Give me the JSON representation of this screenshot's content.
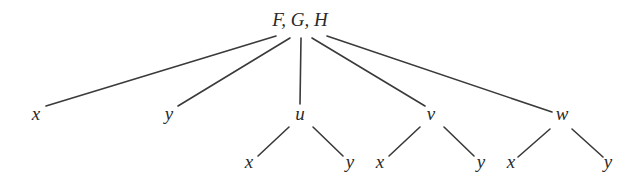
{
  "diagram": {
    "type": "tree",
    "root": {
      "id": "root",
      "label": "F, G, H",
      "x": 300,
      "y": 26
    },
    "nodes": [
      {
        "id": "x1",
        "label": "x",
        "x": 36,
        "y": 120
      },
      {
        "id": "y1",
        "label": "y",
        "x": 169,
        "y": 120
      },
      {
        "id": "u",
        "label": "u",
        "x": 300,
        "y": 120
      },
      {
        "id": "v",
        "label": "v",
        "x": 431,
        "y": 120
      },
      {
        "id": "w",
        "label": "w",
        "x": 562,
        "y": 120
      },
      {
        "id": "ux",
        "label": "x",
        "x": 249,
        "y": 168
      },
      {
        "id": "uy",
        "label": "y",
        "x": 350,
        "y": 168
      },
      {
        "id": "vx",
        "label": "x",
        "x": 380,
        "y": 168
      },
      {
        "id": "vy",
        "label": "y",
        "x": 481,
        "y": 168
      },
      {
        "id": "wx",
        "label": "x",
        "x": 511,
        "y": 168
      },
      {
        "id": "wy",
        "label": "y",
        "x": 608,
        "y": 168
      }
    ],
    "edges": [
      {
        "from": "root",
        "to": "x1",
        "x1": 276,
        "y1": 36,
        "x2": 46,
        "y2": 106
      },
      {
        "from": "root",
        "to": "y1",
        "x1": 290,
        "y1": 38,
        "x2": 178,
        "y2": 106
      },
      {
        "from": "root",
        "to": "u",
        "x1": 301,
        "y1": 38,
        "x2": 300,
        "y2": 104
      },
      {
        "from": "root",
        "to": "v",
        "x1": 312,
        "y1": 38,
        "x2": 425,
        "y2": 106
      },
      {
        "from": "root",
        "to": "w",
        "x1": 327,
        "y1": 36,
        "x2": 552,
        "y2": 112
      },
      {
        "from": "u",
        "to": "ux",
        "x1": 289,
        "y1": 127,
        "x2": 258,
        "y2": 156
      },
      {
        "from": "u",
        "to": "uy",
        "x1": 313,
        "y1": 127,
        "x2": 343,
        "y2": 156
      },
      {
        "from": "v",
        "to": "vx",
        "x1": 420,
        "y1": 127,
        "x2": 389,
        "y2": 156
      },
      {
        "from": "v",
        "to": "vy",
        "x1": 444,
        "y1": 127,
        "x2": 474,
        "y2": 156
      },
      {
        "from": "w",
        "to": "wx",
        "x1": 550,
        "y1": 129,
        "x2": 518,
        "y2": 157
      },
      {
        "from": "w",
        "to": "wy",
        "x1": 572,
        "y1": 129,
        "x2": 603,
        "y2": 157
      }
    ]
  }
}
